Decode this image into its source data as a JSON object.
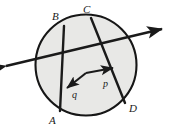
{
  "figure": {
    "kind": "geometry-diagram",
    "width": 172,
    "height": 132,
    "background_color": "#ffffff",
    "stroke_color": "#1a1a1a",
    "circle_fill_color": "#e8e8e6",
    "circle_stroke_color": "#161616"
  },
  "circle": {
    "name": "main-circle",
    "center_x": 86,
    "center_y": 65,
    "radius": 50.5,
    "stroke_width": 2.1
  },
  "chords": [
    {
      "name": "chord-ab",
      "from_label": "B",
      "to_label": "A",
      "x1": 64,
      "y1": 26,
      "x2": 60,
      "y2": 111,
      "stroke_width": 2.4
    },
    {
      "name": "chord-cd",
      "from_label": "C",
      "to_label": "D",
      "x1": 91,
      "y1": 18,
      "x2": 125,
      "y2": 103,
      "stroke_width": 2.4
    }
  ],
  "secant_line": {
    "name": "double-arrow-secant",
    "x1": 6,
    "y1": 66,
    "x2": 162,
    "y2": 29,
    "stroke_width": 2.4,
    "arrow_start": true,
    "arrow_end": true
  },
  "vectors": [
    {
      "name": "vector-p",
      "label": "p",
      "origin_x": 86,
      "origin_y": 73,
      "tip_x": 113,
      "tip_y": 68,
      "stroke_width": 2.1,
      "label_x": 103,
      "label_y": 79
    },
    {
      "name": "vector-q",
      "label": "q",
      "origin_x": 86,
      "origin_y": 73,
      "tip_x": 67,
      "tip_y": 88,
      "stroke_width": 2.1,
      "label_x": 72,
      "label_y": 90
    }
  ],
  "point_labels": [
    {
      "name": "label-point-b",
      "text": "B",
      "x": 52,
      "y": 11
    },
    {
      "name": "label-point-c",
      "text": "C",
      "x": 83,
      "y": 4
    },
    {
      "name": "label-point-a",
      "text": "A",
      "x": 49,
      "y": 115
    },
    {
      "name": "label-point-d",
      "text": "D",
      "x": 129,
      "y": 103
    }
  ]
}
